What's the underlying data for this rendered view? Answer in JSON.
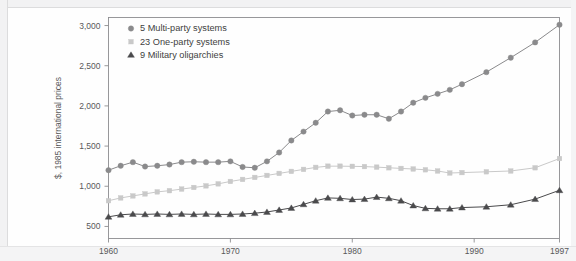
{
  "figure": {
    "background_color": "#fefefe",
    "frame_color": "#8d8d90",
    "page_edge_color": "#f2f2f3"
  },
  "axes": {
    "y_title": "$, 1985 international prices",
    "y_ticks": [
      "500",
      "1,000",
      "1,500",
      "2,000",
      "2,500",
      "3,000"
    ],
    "x_ticks": [
      "1960",
      "1970",
      "1980",
      "1990",
      "1997"
    ]
  },
  "legend": {
    "items": [
      {
        "label": "5 Multi-party systems",
        "marker": "circle-marker",
        "color": "#8a8a8c"
      },
      {
        "label": "23 One-party systems",
        "marker": "square-marker",
        "color": "#c9c9c9"
      },
      {
        "label": "9 Military oligarchies",
        "marker": "triangle-marker",
        "color": "#4a4a4c"
      }
    ]
  },
  "chart_data": {
    "type": "line",
    "title": "",
    "subtitle": "",
    "xlabel": "",
    "ylabel": "$, 1985 international prices",
    "xlim": [
      1960,
      1997
    ],
    "ylim": [
      350,
      3100
    ],
    "grid": false,
    "legend_position": "top-left inside plot",
    "x_tick_values": [
      1960,
      1970,
      1980,
      1990,
      1997
    ],
    "y_tick_values": [
      500,
      1000,
      1500,
      2000,
      2500,
      3000
    ],
    "x": [
      1960,
      1961,
      1962,
      1963,
      1964,
      1965,
      1966,
      1967,
      1968,
      1969,
      1970,
      1971,
      1972,
      1973,
      1974,
      1975,
      1976,
      1977,
      1978,
      1979,
      1980,
      1981,
      1982,
      1983,
      1984,
      1985,
      1986,
      1987,
      1988,
      1989,
      1991,
      1993,
      1995,
      1997
    ],
    "series": [
      {
        "name": "5 Multi-party systems",
        "marker": "circle",
        "color": "#8a8a8c",
        "values": [
          1200,
          1255,
          1300,
          1245,
          1255,
          1270,
          1300,
          1305,
          1300,
          1300,
          1310,
          1240,
          1230,
          1310,
          1420,
          1570,
          1680,
          1790,
          1930,
          1945,
          1880,
          1890,
          1890,
          1840,
          1930,
          2040,
          2100,
          2150,
          2200,
          2270,
          2420,
          2600,
          2790,
          3010
        ]
      },
      {
        "name": "23 One-party systems",
        "marker": "square",
        "color": "#c9c9c9",
        "values": [
          820,
          855,
          880,
          905,
          930,
          945,
          965,
          985,
          1005,
          1030,
          1060,
          1085,
          1110,
          1135,
          1160,
          1185,
          1210,
          1235,
          1250,
          1250,
          1248,
          1245,
          1238,
          1230,
          1222,
          1215,
          1205,
          1190,
          1165,
          1170,
          1180,
          1190,
          1230,
          1345
        ]
      },
      {
        "name": "9 Military oligarchies",
        "marker": "triangle",
        "color": "#4a4a4c",
        "values": [
          620,
          645,
          655,
          650,
          655,
          650,
          655,
          650,
          655,
          650,
          650,
          655,
          665,
          680,
          705,
          730,
          775,
          820,
          855,
          850,
          835,
          840,
          865,
          850,
          820,
          760,
          725,
          720,
          720,
          735,
          745,
          770,
          840,
          950
        ]
      }
    ]
  }
}
